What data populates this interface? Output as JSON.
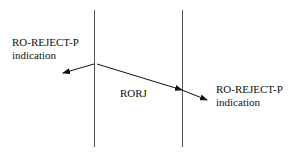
{
  "diagram": {
    "left_label": {
      "line1": "RO-REJECT-P",
      "line2": "indication"
    },
    "middle_label": "RORJ",
    "right_label": {
      "line1": "RO-REJECT-P",
      "line2": "indication"
    },
    "line_color": "#555555",
    "arrow_color": "#111111"
  }
}
